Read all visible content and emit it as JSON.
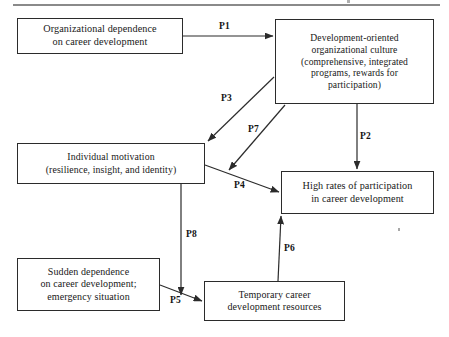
{
  "diagram": {
    "type": "flow-diagram",
    "title_rule": "horizontal-rule",
    "nodes": [
      {
        "id": "organizational-dependence",
        "label": "Organizational dependence\non career development",
        "x": 17,
        "y": 18,
        "w": 166,
        "h": 36,
        "font_size": 10.2
      },
      {
        "id": "development-oriented-culture",
        "label": "Development-oriented\norganizational culture\n(comprehensive, integrated\nprograms, rewards for\nparticipation)",
        "x": 275,
        "y": 19,
        "w": 159,
        "h": 85,
        "font_size": 9.6
      },
      {
        "id": "individual-motivation",
        "label": "Individual motivation\n(resilience, insight, and identity)",
        "x": 17,
        "y": 143,
        "w": 188,
        "h": 41,
        "font_size": 9.8
      },
      {
        "id": "high-rates-participation",
        "label": "High rates of participation\nin career development",
        "x": 281,
        "y": 171,
        "w": 153,
        "h": 43,
        "font_size": 10.2
      },
      {
        "id": "sudden-dependence",
        "label": "Sudden dependence\non career development;\nemergency situation",
        "x": 17,
        "y": 258,
        "w": 143,
        "h": 53,
        "font_size": 10.0
      },
      {
        "id": "temporary-career-resources",
        "label": "Temporary career\ndevelopment resources",
        "x": 204,
        "y": 281,
        "w": 141,
        "h": 40,
        "font_size": 10.0
      }
    ],
    "edges": [
      {
        "id": "P1",
        "label": "P1",
        "from": "organizational-dependence",
        "to": "development-oriented-culture",
        "label_x": 219,
        "label_y": 21
      },
      {
        "id": "P2",
        "label": "P2",
        "from": "development-oriented-culture",
        "to": "high-rates-participation",
        "label_x": 360,
        "label_y": 131
      },
      {
        "id": "P3",
        "label": "P3",
        "from": "development-oriented-culture",
        "to": "individual-motivation",
        "label_x": 221,
        "label_y": 93
      },
      {
        "id": "P4",
        "label": "P4",
        "from": "individual-motivation",
        "to": "high-rates-participation",
        "label_x": 234,
        "label_y": 180
      },
      {
        "id": "P5",
        "label": "P5",
        "from": "sudden-dependence",
        "to": "temporary-career-resources",
        "label_x": 170,
        "label_y": 295
      },
      {
        "id": "P6",
        "label": "P6",
        "from": "temporary-career-resources",
        "to": "high-rates-participation",
        "label_x": 284,
        "label_y": 243
      },
      {
        "id": "P7",
        "label": "P7",
        "from": "development-oriented-culture",
        "to": "high-rates-participation",
        "label_x": 248,
        "label_y": 124
      },
      {
        "id": "P8",
        "label": "P8",
        "from": "individual-motivation",
        "to": "temporary-career-resources",
        "label_x": 186,
        "label_y": 229
      }
    ],
    "colors": {
      "box_border": "#2b2b2b",
      "line": "#2b2b2b",
      "text": "#181818",
      "rule": "#8a8a8a",
      "background": "#ffffff"
    }
  }
}
